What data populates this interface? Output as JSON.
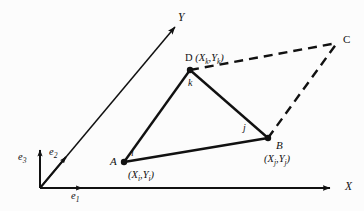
{
  "figure": {
    "type": "geometry-diagram",
    "background_color": "#fcfcfc",
    "line_color": "#111111"
  },
  "axes": {
    "origin_label": "",
    "x_axis_label": "X",
    "y_axis_label": "Y"
  },
  "basis_vectors": [
    {
      "name": "e1",
      "base": "e",
      "sub": "1"
    },
    {
      "name": "e2",
      "base": "e",
      "sub": "2"
    },
    {
      "name": "e3",
      "base": "e",
      "sub": "3"
    }
  ],
  "nodes": [
    {
      "id": "A",
      "label": "A",
      "coord_text": "(X",
      "coord_sub1": "i",
      "coord_mid": ",Y",
      "coord_sub2": "i",
      "coord_end": ")",
      "x": 124,
      "y": 162
    },
    {
      "id": "B",
      "label": "B",
      "coord_text": "(X",
      "coord_sub1": "j",
      "coord_mid": ",Y",
      "coord_sub2": "j",
      "coord_end": ")",
      "x": 268,
      "y": 138
    },
    {
      "id": "D",
      "label": "D",
      "coord_text": "(X",
      "coord_sub1": "k",
      "coord_mid": ",Y",
      "coord_sub2": "k",
      "coord_end": ")",
      "x": 190,
      "y": 70
    },
    {
      "id": "C",
      "label": "C",
      "coord_text": "",
      "x": 337,
      "y": 43
    }
  ],
  "edge_labels": [
    {
      "id": "i",
      "label": "i"
    },
    {
      "id": "j",
      "label": "j"
    },
    {
      "id": "k",
      "label": "k"
    }
  ]
}
